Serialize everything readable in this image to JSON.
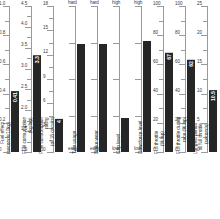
{
  "chart_data": {
    "type": "bar",
    "title": "",
    "subtitle": "",
    "xlabel": "",
    "ylabel": "",
    "grid": false,
    "legend": "none",
    "layout": "small-multiples-vertical-bars",
    "panels": [
      {
        "id": "fuel-effect",
        "caption": "Fuel effect\n(seconds/10kg)",
        "scale": "numeric",
        "ylim": [
          0,
          1.0
        ],
        "ticks": [
          0,
          0.2,
          0.4,
          0.6,
          0.8,
          1.0
        ],
        "tick_labels": [
          "0",
          "0.2",
          "0.4",
          "0.6",
          "0.8",
          "1.0"
        ],
        "minor_ticks": [
          0.1,
          0.3,
          0.5,
          0.7,
          0.9
        ],
        "value": 0.41,
        "value_label": "0.41"
      },
      {
        "id": "fuel-consumption",
        "caption": "Fuel consumption\n(kg/lap)",
        "scale": "numeric",
        "ylim": [
          1.0,
          4.5
        ],
        "ticks": [
          1.0,
          1.5,
          2.0,
          2.5,
          3.0,
          3.5,
          4.0,
          4.5
        ],
        "tick_labels": [
          "1.0",
          "1.5",
          "2.0",
          "2.5",
          "3.0",
          "3.5",
          "4.0",
          "4.5"
        ],
        "minor_ticks": [
          1.25,
          1.75,
          2.25,
          2.75,
          3.25,
          3.75,
          4.25
        ],
        "value": 3.3,
        "value_label": "3.3"
      },
      {
        "id": "fuel-consumption-rating",
        "caption": "Fuel consumption\nrating\n(of 18 circuits)",
        "scale": "numeric",
        "ylim": [
          0,
          18
        ],
        "ticks": [
          0,
          3,
          6,
          9,
          12,
          15,
          18
        ],
        "tick_labels": [
          "0",
          "3",
          "6",
          "9",
          "12",
          "15",
          "18"
        ],
        "minor_ticks": [
          1.5,
          4.5,
          7.5,
          10.5,
          13.5,
          16.5
        ],
        "value": 4,
        "value_label": "4"
      },
      {
        "id": "tyre-usage",
        "caption": "Tyre usage",
        "scale": "categorical",
        "top_label": "hard",
        "bottom_label": "easy",
        "ticks_fraction": [
          0.0,
          0.25,
          0.5,
          0.75,
          1.0
        ],
        "value_fraction": 0.74,
        "value_label": ""
      },
      {
        "id": "brake-wear",
        "caption": "Brake wear",
        "scale": "categorical",
        "top_label": "hard",
        "bottom_label": "easy",
        "ticks_fraction": [
          0.0,
          0.25,
          0.5,
          0.75,
          1.0
        ],
        "value_fraction": 0.74,
        "value_label": ""
      },
      {
        "id": "grip-level",
        "caption": "Grip level",
        "scale": "categorical",
        "top_label": "high",
        "bottom_label": "low",
        "ticks_fraction": [
          0.0,
          0.25,
          0.5,
          0.75,
          1.0
        ],
        "value_fraction": 0.23,
        "value_label": ""
      },
      {
        "id": "downforce-level",
        "caption": "Downforce level",
        "scale": "categorical",
        "top_label": "high",
        "bottom_label": "low",
        "ticks_fraction": [
          0.0,
          0.25,
          0.5,
          0.75,
          1.0
        ],
        "value_fraction": 0.76,
        "value_label": ""
      },
      {
        "id": "full-throttle",
        "caption": "Full throttle\n(% lap)",
        "scale": "numeric",
        "ylim": [
          0,
          100
        ],
        "ticks": [
          0,
          20,
          40,
          60,
          80,
          100
        ],
        "tick_labels": [
          "0",
          "20",
          "40",
          "60",
          "80",
          "100"
        ],
        "minor_ticks": [
          10,
          30,
          50,
          70,
          90
        ],
        "value": 67,
        "value_label": "67"
      },
      {
        "id": "full-throttle-race",
        "caption": "Full throttle during\nrace (% lap)",
        "scale": "numeric",
        "ylim": [
          0,
          100
        ],
        "ticks": [
          0,
          20,
          40,
          60,
          80,
          100
        ],
        "tick_labels": [
          "0",
          "20",
          "40",
          "60",
          "80",
          "100"
        ],
        "minor_ticks": [
          10,
          30,
          50,
          70,
          90
        ],
        "value": 62,
        "value_label": "62"
      },
      {
        "id": "longest-full-throttle",
        "caption": "Longest period\nat full throttle\n(seconds)",
        "scale": "numeric",
        "ylim": [
          0,
          25
        ],
        "ticks": [
          0,
          5,
          10,
          15,
          20,
          25
        ],
        "tick_labels": [
          "0",
          "5",
          "10",
          "15",
          "20",
          "25"
        ],
        "minor_ticks": [
          2.5,
          7.5,
          12.5,
          17.5,
          22.5
        ],
        "value": 10.5,
        "value_label": "10.5"
      }
    ]
  }
}
